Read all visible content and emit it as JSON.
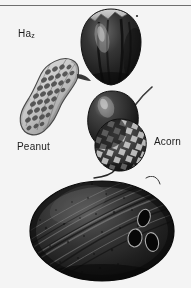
{
  "page": {
    "background_color": "#f4f4f2",
    "rule_color": "#6e6e6e",
    "width": 191,
    "height": 288
  },
  "labels": {
    "hazelnut": {
      "text": "Ha",
      "subscript": "z"
    },
    "peanut": {
      "text": "Peanut"
    },
    "acorn": {
      "text": "Acorn"
    }
  },
  "figures": [
    {
      "name": "hazelnut",
      "caption": "Ha"
    },
    {
      "name": "peanut",
      "caption": "Peanut"
    },
    {
      "name": "acorn",
      "caption": "Acorn"
    },
    {
      "name": "coconut",
      "caption": ""
    }
  ],
  "colors": {
    "nut_dark": "#1a1714",
    "nut_mid": "#4a423a",
    "nut_light": "#cdc7bc",
    "shell_pale": "#d9d4c8",
    "ink": "#1c1c1c"
  }
}
